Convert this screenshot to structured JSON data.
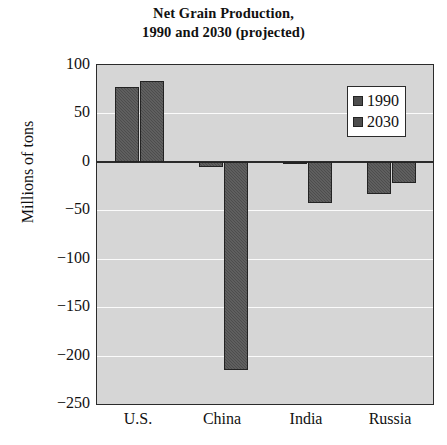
{
  "chart_data": {
    "type": "bar",
    "title": "Net Grain Production, 1990 and 2030 (projected)",
    "title_lines": [
      "Net Grain Production,",
      "1990 and 2030 (projected)"
    ],
    "xlabel": "",
    "ylabel": "Millions of tons",
    "categories": [
      "U.S.",
      "China",
      "India",
      "Russia"
    ],
    "series": [
      {
        "name": "1990",
        "values": [
          77,
          -5,
          -2,
          -33
        ],
        "color": "#4d4d4d"
      },
      {
        "name": "2030",
        "values": [
          83,
          -215,
          -42,
          -22
        ],
        "color": "#4d4d4d"
      }
    ],
    "ylim": [
      -250,
      100
    ],
    "yticks": [
      100,
      50,
      0,
      -50,
      -100,
      -150,
      -200,
      -250
    ],
    "ytick_labels": [
      "100",
      "50",
      "0",
      "−50",
      "−100",
      "−150",
      "−200",
      "−250"
    ],
    "grid": true,
    "gridline_color": "#fbfbfb",
    "zero_line": true,
    "plot_background": "#d6d6d6",
    "legend": {
      "position": "upper-right-inside",
      "entries": [
        {
          "label": "1990",
          "swatch": "legend-swatch-1990"
        },
        {
          "label": "2030",
          "swatch": "legend-swatch-2030"
        }
      ]
    }
  }
}
